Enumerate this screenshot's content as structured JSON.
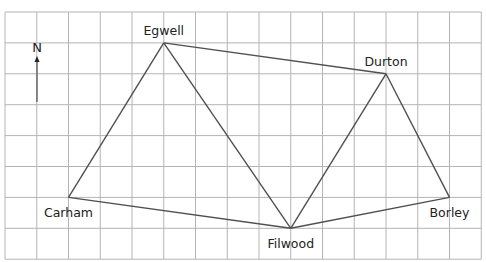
{
  "map": {
    "type": "grid-map",
    "grid": {
      "columns": 15,
      "rows": 8
    },
    "north_label": "N",
    "towns": [
      {
        "name": "Egwell",
        "col": 5,
        "row": 1,
        "label_pos": "above"
      },
      {
        "name": "Durton",
        "col": 12,
        "row": 2,
        "label_pos": "above"
      },
      {
        "name": "Carham",
        "col": 2,
        "row": 6,
        "label_pos": "below"
      },
      {
        "name": "Filwood",
        "col": 9,
        "row": 7,
        "label_pos": "below"
      },
      {
        "name": "Borley",
        "col": 14,
        "row": 6,
        "label_pos": "below"
      }
    ],
    "routes": [
      [
        "Carham",
        "Egwell"
      ],
      [
        "Egwell",
        "Durton"
      ],
      [
        "Egwell",
        "Filwood"
      ],
      [
        "Carham",
        "Filwood"
      ],
      [
        "Filwood",
        "Durton"
      ],
      [
        "Durton",
        "Borley"
      ],
      [
        "Filwood",
        "Borley"
      ]
    ],
    "colors": {
      "grid": "#b4b4b4",
      "route": "#505050",
      "text": "#222222"
    }
  }
}
